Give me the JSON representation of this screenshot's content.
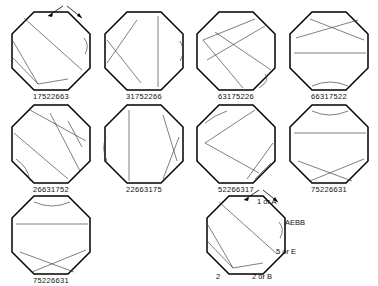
{
  "figure": {
    "title": "",
    "type": "octagon-diagram-grid",
    "background": "#ffffff",
    "outline_color": "#000000",
    "chord_color": "#3a3a3a",
    "rows": 3,
    "columns": 4
  },
  "cells": [
    {
      "id": "cell-1",
      "label": "17522663",
      "row": 1,
      "col": 1,
      "chords": "M 16,10 L 74,62 M 5,33 L 30,76 M 5,50 L 30,76 M 30,76 L 60,71",
      "arc": "M 76,30 Q 82,37 77,46",
      "arrows": true
    },
    {
      "id": "cell-2",
      "label": "31752266",
      "row": 1,
      "col": 2,
      "chords": "M 57,8 L 57,79 M 6,32 L 40,75 M 6,55 L 36,12",
      "arc": "M 79,33 Q 85,43 79,53",
      "arrows": false
    },
    {
      "id": "cell-3",
      "label": "63175226",
      "row": 1,
      "col": 3,
      "chords": "M 10,32 L 62,11 M 10,32 L 50,80 M 14,52 L 72,18 M 22,24 L 78,62",
      "arc": "M 72,66 Q 78,72 66,80",
      "arrows": false
    },
    {
      "id": "cell-4",
      "label": "66317522",
      "row": 1,
      "col": 4,
      "chords": "M 10,30 L 72,12 M 24,11 L 78,32 M 8,45 L 80,45",
      "arc": "M 26,78 Q 44,70 62,78",
      "arrows": false
    },
    {
      "id": "cell-5",
      "label": "26631752",
      "row": 2,
      "col": 1,
      "chords": "M 22,9 L 78,40 M 6,32 L 60,78 M 42,12 L 72,70 M 60,20 L 74,46",
      "arc": "M 8,58 Q 20,66 22,80",
      "arrows": false
    },
    {
      "id": "cell-6",
      "label": "22663175",
      "row": 2,
      "col": 2,
      "chords": "M 28,9 L 28,80 M 62,14 L 76,60 M 62,78 L 78,36",
      "arc": "M 5,36 Q 0,48 6,60",
      "arrows": false
    },
    {
      "id": "cell-7",
      "label": "52266317",
      "row": 2,
      "col": 3,
      "chords": "M 12,42 L 62,9 M 12,42 L 66,72 M 54,78 L 80,42 M 62,78 L 78,62",
      "arc": "M 12,22 Q 22,14 34,10",
      "arrows": false
    },
    {
      "id": "cell-8",
      "label": "75226631",
      "row": 2,
      "col": 4,
      "chords": "M 8,32 L 80,32 M 12,60 L 66,80 M 24,80 L 78,58",
      "arc": "M 26,10 Q 44,18 62,10",
      "arrows": false
    },
    {
      "id": "cell-9",
      "label": "75226631",
      "row": 3,
      "col": 1,
      "chords": "M 8,32 L 80,32 M 12,60 L 66,80 M 24,80 L 78,58",
      "arc": "M 26,10 Q 44,18 62,10",
      "arrows": false
    },
    {
      "id": "cell-10",
      "label": "",
      "row": 3,
      "col": 3,
      "chords": "M 16,10 L 74,62 M 5,33 L 30,76 M 5,50 L 30,76 M 30,76 L 60,71",
      "arc": "M 76,30 Q 82,37 77,46",
      "arrows": true
    }
  ],
  "annotations": {
    "vertex_1": "1 or A",
    "code": "AEBB",
    "vertex_5": "5 or E",
    "vertex_2_left": "2",
    "vertex_2_or_b": "2 or B"
  }
}
